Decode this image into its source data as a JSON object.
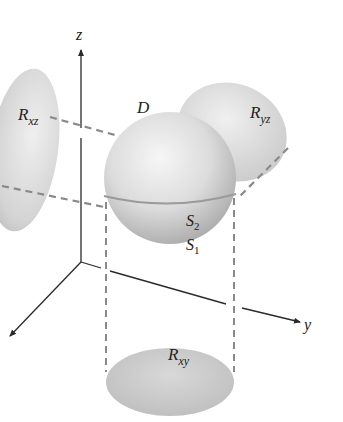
{
  "figure": {
    "labels": {
      "z_axis": "z",
      "y_axis": "y",
      "x_axis": "x",
      "region": "D",
      "upper_surface_base": "S",
      "upper_surface_sub": "2",
      "lower_surface_base": "S",
      "lower_surface_sub": "1",
      "proj_xz_base": "R",
      "proj_xz_sub": "xz",
      "proj_yz_base": "R",
      "proj_yz_sub": "yz",
      "proj_xy_base": "R",
      "proj_xy_sub": "xy"
    },
    "colors": {
      "axis": "#2a2a2a",
      "dash": "#8a8a8a",
      "sphere_light": "#f2f2f2",
      "sphere_dark": "#a9a9a9",
      "projection": "#cfcfcf",
      "background": "#ffffff"
    }
  }
}
